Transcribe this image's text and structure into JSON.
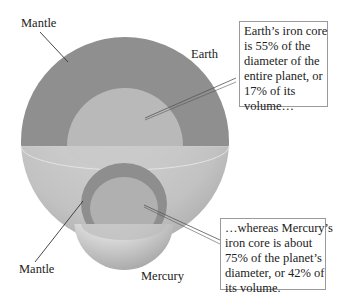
{
  "labels": {
    "mantle_top": "Mantle",
    "earth": "Earth",
    "mantle_bottom": "Mantle",
    "mercury": "Mercury"
  },
  "callouts": {
    "earth": {
      "lines": [
        "Earth’s iron core",
        "is 55% of the",
        "diameter of the",
        "entire planet, or",
        "17% of its",
        "volume…"
      ]
    },
    "mercury": {
      "lines": [
        "…whereas Mercury’s",
        "iron core is about",
        "75% of the planet’s",
        "diameter, or 42% of",
        "its volume."
      ]
    }
  },
  "colors": {
    "mantle": "#8f8f8f",
    "core": "#b9b9b9",
    "lower_hemisphere": "#c8c8c8",
    "label_text": "#222222",
    "callout_border": "#9a9a9a"
  }
}
